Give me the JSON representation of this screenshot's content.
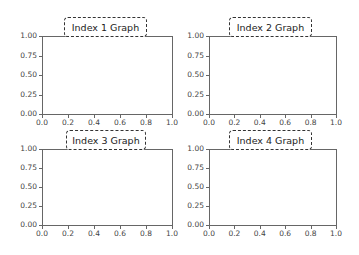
{
  "chart_data": [
    {
      "type": "line",
      "title": "Index 1 Graph",
      "series": [],
      "xlabel": "",
      "ylabel": "",
      "xlim": [
        0.0,
        1.0
      ],
      "ylim": [
        0.0,
        1.0
      ],
      "xticks": [
        "0.0",
        "0.2",
        "0.4",
        "0.6",
        "0.8",
        "1.0"
      ],
      "yticks": [
        "0.00",
        "0.25",
        "0.50",
        "0.75",
        "1.00"
      ],
      "grid": false,
      "title_style": "dashed rounded box"
    },
    {
      "type": "line",
      "title": "Index 2 Graph",
      "series": [],
      "xlabel": "",
      "ylabel": "",
      "xlim": [
        0.0,
        1.0
      ],
      "ylim": [
        0.0,
        1.0
      ],
      "xticks": [
        "0.0",
        "0.2",
        "0.4",
        "0.6",
        "0.8",
        "1.0"
      ],
      "yticks": [
        "0.00",
        "0.25",
        "0.50",
        "0.75",
        "1.00"
      ],
      "grid": false,
      "title_style": "dashed rounded box"
    },
    {
      "type": "line",
      "title": "Index 3 Graph",
      "series": [],
      "xlabel": "",
      "ylabel": "",
      "xlim": [
        0.0,
        1.0
      ],
      "ylim": [
        0.0,
        1.0
      ],
      "xticks": [
        "0.0",
        "0.2",
        "0.4",
        "0.6",
        "0.8",
        "1.0"
      ],
      "yticks": [
        "0.00",
        "0.25",
        "0.50",
        "0.75",
        "1.00"
      ],
      "grid": false,
      "title_style": "dashed rounded box"
    },
    {
      "type": "line",
      "title": "Index 4 Graph",
      "series": [],
      "xlabel": "",
      "ylabel": "",
      "xlim": [
        0.0,
        1.0
      ],
      "ylim": [
        0.0,
        1.0
      ],
      "xticks": [
        "0.0",
        "0.2",
        "0.4",
        "0.6",
        "0.8",
        "1.0"
      ],
      "yticks": [
        "0.00",
        "0.25",
        "0.50",
        "0.75",
        "1.00"
      ],
      "grid": false,
      "title_style": "dashed rounded box"
    }
  ],
  "colors": {
    "frame": "#666666",
    "title_border": "#333333",
    "background": "#ffffff"
  }
}
